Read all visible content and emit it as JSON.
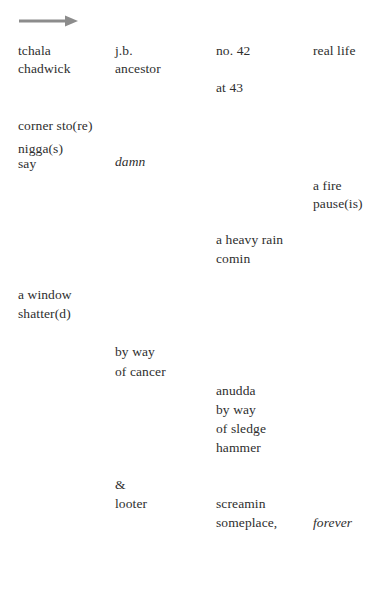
{
  "page": {
    "background_color": "#ffffff",
    "text_color": "#2e2e2e",
    "width": 386,
    "height": 598
  },
  "arrow": {
    "name": "right-arrow-graphic",
    "color": "#8c8c8c",
    "direction": "right"
  },
  "columns": {
    "c1_x": 18,
    "c2_x": 115,
    "c3_x": 216,
    "c4_x": 313
  },
  "lines": [
    {
      "text": "tchala",
      "column": 1,
      "top": 44,
      "style": "roman"
    },
    {
      "text": "chadwick",
      "column": 1,
      "top": 62,
      "style": "roman"
    },
    {
      "text": "j.b.",
      "column": 2,
      "top": 44,
      "style": "roman"
    },
    {
      "text": "ancestor",
      "column": 2,
      "top": 62,
      "style": "roman"
    },
    {
      "text": "no. 42",
      "column": 3,
      "top": 44,
      "style": "roman"
    },
    {
      "text": "at 43",
      "column": 3,
      "top": 81,
      "style": "roman"
    },
    {
      "text": "real life",
      "column": 4,
      "top": 44,
      "style": "roman"
    },
    {
      "text": "corner sto(re)",
      "column": 1,
      "top": 119,
      "style": "roman"
    },
    {
      "text": "nigga(s)",
      "column": 1,
      "top": 142,
      "style": "roman"
    },
    {
      "text": "say",
      "column": 1,
      "top": 157,
      "style": "roman"
    },
    {
      "text": "damn",
      "column": 2,
      "top": 155,
      "style": "italic"
    },
    {
      "text": "a fire",
      "column": 4,
      "top": 179,
      "style": "roman"
    },
    {
      "text": "pause(is)",
      "column": 4,
      "top": 197,
      "style": "roman"
    },
    {
      "text": "a heavy rain",
      "column": 3,
      "top": 233,
      "style": "roman"
    },
    {
      "text": "comin",
      "column": 3,
      "top": 252,
      "style": "roman"
    },
    {
      "text": "a window",
      "column": 1,
      "top": 288,
      "style": "roman"
    },
    {
      "text": "shatter(d)",
      "column": 1,
      "top": 307,
      "style": "roman"
    },
    {
      "text": "by way",
      "column": 2,
      "top": 345,
      "style": "roman"
    },
    {
      "text": "of cancer",
      "column": 2,
      "top": 365,
      "style": "roman"
    },
    {
      "text": "anudda",
      "column": 3,
      "top": 384,
      "style": "roman"
    },
    {
      "text": "by way",
      "column": 3,
      "top": 403,
      "style": "roman"
    },
    {
      "text": "of sledge",
      "column": 3,
      "top": 422,
      "style": "roman"
    },
    {
      "text": "hammer",
      "column": 3,
      "top": 441,
      "style": "roman"
    },
    {
      "text": "&",
      "column": 2,
      "top": 478,
      "style": "roman"
    },
    {
      "text": "looter",
      "column": 2,
      "top": 497,
      "style": "roman"
    },
    {
      "text": "screamin",
      "column": 3,
      "top": 497,
      "style": "roman"
    },
    {
      "text": "someplace,",
      "column": 3,
      "top": 516,
      "style": "roman"
    },
    {
      "text": "forever",
      "column": 4,
      "top": 516,
      "style": "italic"
    }
  ]
}
